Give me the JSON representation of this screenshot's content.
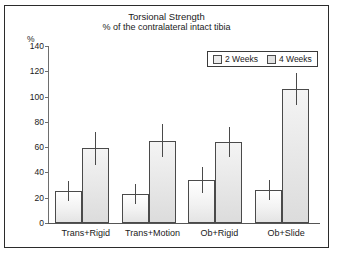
{
  "chart_data": {
    "type": "bar",
    "title": "Torsional Strength",
    "subtitle": "% of the contralateral intact tibia",
    "xlabel": "",
    "ylabel": "%",
    "ylim": [
      0,
      140
    ],
    "yticks": [
      0,
      20,
      40,
      60,
      80,
      100,
      120,
      140
    ],
    "grid": false,
    "legend_position": "top-right",
    "categories": [
      "Trans+Rigid",
      "Trans+Motion",
      "Ob+Rigid",
      "Ob+Slide"
    ],
    "series": [
      {
        "name": "2 Weeks",
        "values": [
          25,
          23,
          34,
          26
        ],
        "errors_upper": [
          8,
          8,
          10,
          8
        ],
        "errors_lower": [
          8,
          8,
          10,
          8
        ],
        "color": "#f0f0f0"
      },
      {
        "name": "4 Weeks",
        "values": [
          59,
          65,
          64,
          106
        ],
        "errors_upper": [
          13,
          13,
          12,
          13
        ],
        "errors_lower": [
          13,
          13,
          12,
          13
        ],
        "color": "#e4e4e4"
      }
    ]
  },
  "legend": {
    "items": [
      {
        "label": "2 Weeks"
      },
      {
        "label": "4 Weeks"
      }
    ]
  }
}
